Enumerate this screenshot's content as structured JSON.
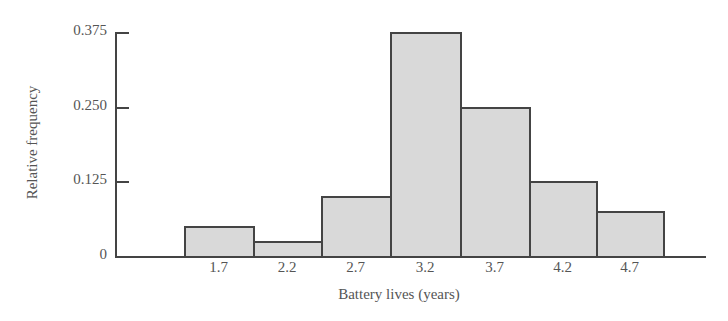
{
  "chart_data": {
    "type": "bar",
    "title": "",
    "xlabel": "Battery lives (years)",
    "ylabel": "Relative frequency",
    "categories": [
      "1.7",
      "2.2",
      "2.7",
      "3.2",
      "3.7",
      "4.2",
      "4.7"
    ],
    "values": [
      0.05,
      0.025,
      0.1,
      0.375,
      0.25,
      0.125,
      0.075
    ],
    "yticks": [
      "0",
      "0.125",
      "0.250",
      "0.375"
    ],
    "ytick_values": [
      0,
      0.125,
      0.25,
      0.375
    ],
    "ylim": [
      0,
      0.375
    ],
    "grid": false,
    "legend": null,
    "bar_style": "histogram (adjacent bars, light gray fill, dark outline)",
    "colors": {
      "fill": "#d9d9d9",
      "edge": "#444444",
      "text": "#555555"
    }
  }
}
